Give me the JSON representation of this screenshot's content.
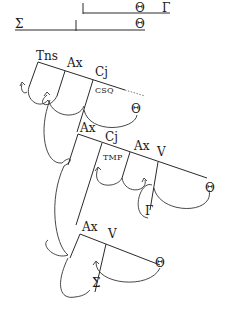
{
  "top_rows": {
    "row1": {
      "theta": "Θ",
      "gamma": "Γ"
    },
    "row2": {
      "sigma": "Σ",
      "theta": "Θ"
    }
  },
  "tree": {
    "level1": {
      "tns": "Tns",
      "ax": "Ax",
      "cj": "Cj",
      "cj_sub": "CSQ",
      "theta": "Θ"
    },
    "level2": {
      "ax": "Ax",
      "cj": "Cj",
      "cj_sub": "TMP",
      "ax2": "Ax",
      "v": "V",
      "theta": "Θ",
      "gamma": "Γ"
    },
    "level3": {
      "ax": "Ax",
      "v": "V",
      "theta": "Θ",
      "sigma": "Σ"
    }
  },
  "colors": {
    "line": "#2a2a2a",
    "text": "#1a1a1a",
    "background": "#ffffff"
  }
}
